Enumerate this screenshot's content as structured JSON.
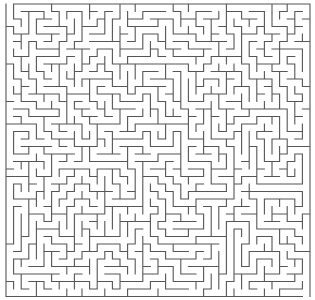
{
  "maze": {
    "cols": 40,
    "rows": 39,
    "origin_x": 6,
    "origin_y": 4,
    "cell_w": 7.6,
    "cell_h": 7.5,
    "seed": 12345,
    "wall_color": "#555555",
    "wall_width": 1.1,
    "background": "#ffffff",
    "entrance": {
      "side": "top",
      "index": 0
    },
    "exit": {
      "side": "bottom",
      "index": 39
    }
  }
}
